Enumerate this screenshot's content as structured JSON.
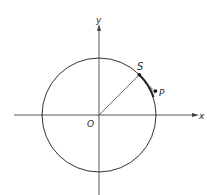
{
  "diagram": {
    "type": "unit-circle-geometry",
    "labels": {
      "y_axis": "y",
      "x_axis": "x",
      "origin": "O",
      "point_s": "S",
      "point_p": "P"
    },
    "colors": {
      "stroke": "#333333",
      "background": "#ffffff"
    }
  }
}
